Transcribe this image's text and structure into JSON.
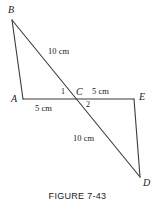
{
  "figure": {
    "caption": "FIGURE 7-43",
    "stroke_color": "#3a3a3a",
    "text_color": "#1a1a1a",
    "background_color": "#ffffff",
    "stroke_width": 1.1
  },
  "vertices": {
    "B": {
      "label": "B",
      "x": 12,
      "y": 20,
      "label_x": 8,
      "label_y": 5
    },
    "A": {
      "label": "A",
      "x": 23,
      "y": 99,
      "label_x": 11,
      "label_y": 94
    },
    "C": {
      "label": "C",
      "x": 77,
      "y": 99,
      "label_x": 76,
      "label_y": 87
    },
    "E": {
      "label": "E",
      "x": 134,
      "y": 99,
      "label_x": 139,
      "label_y": 92
    },
    "D": {
      "label": "D",
      "x": 140,
      "y": 177,
      "label_x": 143,
      "label_y": 178
    }
  },
  "segments": [
    {
      "name": "segment-BA",
      "from": "B",
      "to": "A"
    },
    {
      "name": "segment-BD",
      "from": "B",
      "to": "D"
    },
    {
      "name": "segment-AE",
      "from": "A",
      "to": "E"
    },
    {
      "name": "segment-ED",
      "from": "E",
      "to": "D"
    }
  ],
  "angles": [
    {
      "name": "angle-1",
      "label": "1",
      "x": 61,
      "y": 88
    },
    {
      "name": "angle-2",
      "label": "2",
      "x": 86,
      "y": 101
    }
  ],
  "measures": [
    {
      "name": "measure-bc",
      "label": "10 cm",
      "x": 48,
      "y": 47,
      "segment": "BC"
    },
    {
      "name": "measure-ac",
      "label": "5 cm",
      "x": 35,
      "y": 104,
      "segment": "AC"
    },
    {
      "name": "measure-ce",
      "label": "5 cm",
      "x": 92,
      "y": 87,
      "segment": "CE"
    },
    {
      "name": "measure-cd",
      "label": "10 cm",
      "x": 73,
      "y": 134,
      "segment": "CD"
    }
  ]
}
